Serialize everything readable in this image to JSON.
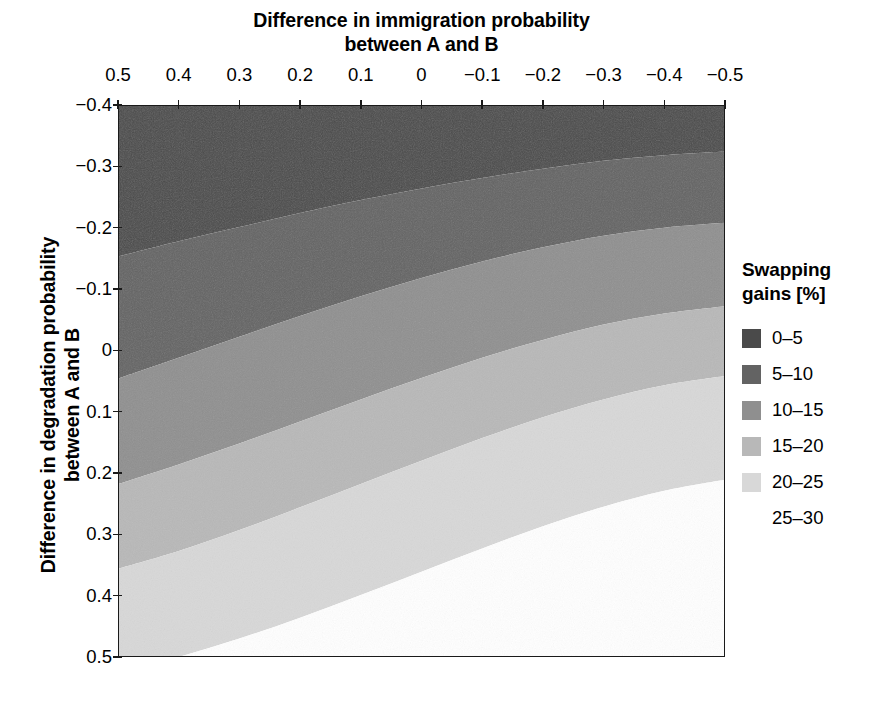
{
  "figure": {
    "x_axis": {
      "title_line1": "Difference in immigration probability",
      "title_line2": "between A and B",
      "tick_labels": [
        "0.5",
        "0.4",
        "0.3",
        "0.2",
        "0.1",
        "0",
        "−0.1",
        "−0.2",
        "−0.3",
        "−0.4",
        "−0.5"
      ],
      "position": "top"
    },
    "y_axis": {
      "title_line1": "Difference in degradation probability",
      "title_line2": "between A and B",
      "tick_labels": [
        "−0.4",
        "−0.3",
        "−0.2",
        "−0.1",
        "0",
        "0.1",
        "0.2",
        "0.3",
        "0.4",
        "0.5"
      ],
      "position": "left"
    },
    "legend": {
      "title_line1": "Swapping",
      "title_line2": "gains [%]",
      "items": [
        {
          "label": "0–5",
          "color": "#4a4a4a"
        },
        {
          "label": "5–10",
          "color": "#636363"
        },
        {
          "label": "10–15",
          "color": "#8f8f8f"
        },
        {
          "label": "15–20",
          "color": "#b8b8b8"
        },
        {
          "label": "20–25",
          "color": "#d8d8d8"
        },
        {
          "label": "25–30",
          "color": "#ffffff"
        }
      ]
    }
  },
  "chart_data": {
    "type": "heatmap",
    "subtype": "filled-contour",
    "title": "Difference in immigration probability between A and B",
    "xlabel": "Difference in immigration probability between A and B",
    "ylabel": "Difference in degradation probability between A and B",
    "xlim": [
      0.5,
      -0.5
    ],
    "ylim": [
      -0.4,
      0.5
    ],
    "x_reversed": true,
    "y_reversed": true,
    "grid": false,
    "legend_position": "right",
    "legend_title": "Swapping gains [%]",
    "value_unit": "%",
    "contour_levels": [
      0,
      5,
      10,
      15,
      20,
      25,
      30
    ],
    "band_labels": [
      "0–5",
      "5–10",
      "10–15",
      "15–20",
      "20–25",
      "25–30"
    ],
    "band_colors": [
      "#4a4a4a",
      "#636363",
      "#8f8f8f",
      "#b8b8b8",
      "#d8d8d8",
      "#ffffff"
    ],
    "x_ticks": [
      0.5,
      0.4,
      0.3,
      0.2,
      0.1,
      0,
      -0.1,
      -0.2,
      -0.3,
      -0.4,
      -0.5
    ],
    "y_ticks": [
      -0.4,
      -0.3,
      -0.2,
      -0.1,
      0,
      0.1,
      0.2,
      0.3,
      0.4,
      0.5
    ],
    "contour_boundaries": [
      {
        "between": "0–5 / 5–10",
        "level": 5,
        "points": [
          {
            "x": 0.5,
            "y": -0.153
          },
          {
            "x": 0.4,
            "y": -0.178
          },
          {
            "x": 0.3,
            "y": -0.201
          },
          {
            "x": 0.2,
            "y": -0.224
          },
          {
            "x": 0.1,
            "y": -0.245
          },
          {
            "x": 0.0,
            "y": -0.264
          },
          {
            "x": -0.1,
            "y": -0.281
          },
          {
            "x": -0.2,
            "y": -0.296
          },
          {
            "x": -0.3,
            "y": -0.309
          },
          {
            "x": -0.4,
            "y": -0.318
          },
          {
            "x": -0.5,
            "y": -0.324
          }
        ]
      },
      {
        "between": "5–10 / 10–15",
        "level": 10,
        "points": [
          {
            "x": 0.5,
            "y": 0.046
          },
          {
            "x": 0.4,
            "y": 0.012
          },
          {
            "x": 0.3,
            "y": -0.022
          },
          {
            "x": 0.2,
            "y": -0.056
          },
          {
            "x": 0.1,
            "y": -0.088
          },
          {
            "x": 0.0,
            "y": -0.118
          },
          {
            "x": -0.1,
            "y": -0.145
          },
          {
            "x": -0.2,
            "y": -0.168
          },
          {
            "x": -0.3,
            "y": -0.187
          },
          {
            "x": -0.4,
            "y": -0.2
          },
          {
            "x": -0.5,
            "y": -0.208
          }
        ]
      },
      {
        "between": "10–15 / 15–20",
        "level": 15,
        "points": [
          {
            "x": 0.5,
            "y": 0.218
          },
          {
            "x": 0.4,
            "y": 0.186
          },
          {
            "x": 0.3,
            "y": 0.152
          },
          {
            "x": 0.2,
            "y": 0.116
          },
          {
            "x": 0.1,
            "y": 0.08
          },
          {
            "x": 0.0,
            "y": 0.045
          },
          {
            "x": -0.1,
            "y": 0.012
          },
          {
            "x": -0.2,
            "y": -0.017
          },
          {
            "x": -0.3,
            "y": -0.042
          },
          {
            "x": -0.4,
            "y": -0.06
          },
          {
            "x": -0.5,
            "y": -0.072
          }
        ]
      },
      {
        "between": "15–20 / 20–25",
        "level": 20,
        "points": [
          {
            "x": 0.5,
            "y": 0.356
          },
          {
            "x": 0.4,
            "y": 0.327
          },
          {
            "x": 0.3,
            "y": 0.293
          },
          {
            "x": 0.2,
            "y": 0.256
          },
          {
            "x": 0.1,
            "y": 0.218
          },
          {
            "x": 0.0,
            "y": 0.18
          },
          {
            "x": -0.1,
            "y": 0.143
          },
          {
            "x": -0.2,
            "y": 0.109
          },
          {
            "x": -0.3,
            "y": 0.08
          },
          {
            "x": -0.4,
            "y": 0.057
          },
          {
            "x": -0.5,
            "y": 0.042
          }
        ]
      },
      {
        "between": "20–25 / 25–30",
        "level": 25,
        "points": [
          {
            "x": 0.5,
            "y": 0.525
          },
          {
            "x": 0.4,
            "y": 0.5
          },
          {
            "x": 0.3,
            "y": 0.47
          },
          {
            "x": 0.2,
            "y": 0.436
          },
          {
            "x": 0.1,
            "y": 0.399
          },
          {
            "x": 0.0,
            "y": 0.361
          },
          {
            "x": -0.1,
            "y": 0.323
          },
          {
            "x": -0.2,
            "y": 0.287
          },
          {
            "x": -0.3,
            "y": 0.255
          },
          {
            "x": -0.4,
            "y": 0.229
          },
          {
            "x": -0.5,
            "y": 0.211
          }
        ]
      }
    ]
  }
}
